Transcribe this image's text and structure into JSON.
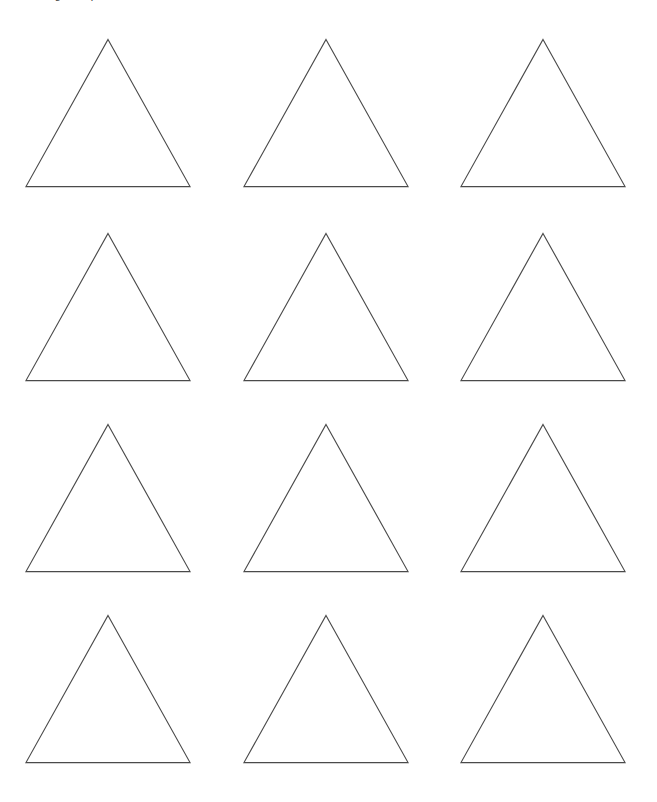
{
  "document": {
    "title_text": "Triangle template",
    "title_clipped": true,
    "background_color": "#ffffff"
  },
  "shapes": {
    "shape_name": "triangle",
    "shape_label": "triangle-outline",
    "fill_color": "#ffffff",
    "stroke_color": "#4a4a4a",
    "stroke_width_px": 1,
    "rows": 4,
    "columns": 3,
    "total_count": 12,
    "base_width_px": 165,
    "height_px": 148,
    "column_pitch_px": 218,
    "row_pitch_px": 191,
    "grid": [
      {
        "row": 1,
        "cells": [
          {
            "index": 1,
            "left": 22,
            "top": 35
          },
          {
            "index": 2,
            "left": 240,
            "top": 35
          },
          {
            "index": 3,
            "left": 457,
            "top": 35
          }
        ]
      },
      {
        "row": 2,
        "cells": [
          {
            "index": 4,
            "left": 22,
            "top": 229
          },
          {
            "index": 5,
            "left": 240,
            "top": 229
          },
          {
            "index": 6,
            "left": 457,
            "top": 229
          }
        ]
      },
      {
        "row": 3,
        "cells": [
          {
            "index": 7,
            "left": 22,
            "top": 420
          },
          {
            "index": 8,
            "left": 240,
            "top": 420
          },
          {
            "index": 9,
            "left": 457,
            "top": 420
          }
        ]
      },
      {
        "row": 4,
        "cells": [
          {
            "index": 10,
            "left": 22,
            "top": 611
          },
          {
            "index": 11,
            "left": 240,
            "top": 611
          },
          {
            "index": 12,
            "left": 457,
            "top": 611
          }
        ]
      }
    ]
  }
}
